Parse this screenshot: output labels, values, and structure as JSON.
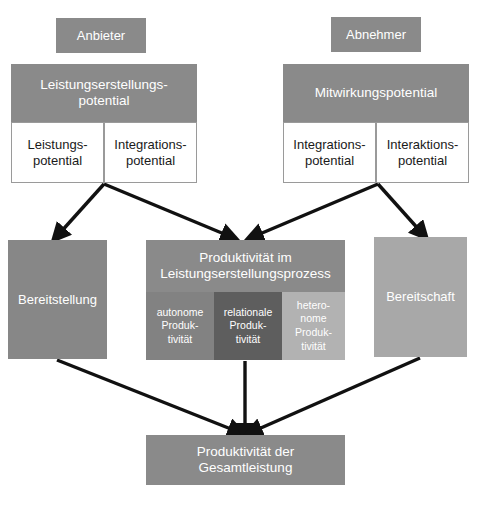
{
  "diagram": {
    "title": "Produktivität der Gesamtleistung",
    "language": "de",
    "actors": {
      "provider": "Anbieter",
      "customer": "Abnehmer"
    },
    "provider_potential": {
      "header": "Leistungserstellungs-\npotential",
      "sub_left": "Leistungs-\npotential",
      "sub_right": "Integrations-\npotential"
    },
    "customer_potential": {
      "header": "Mitwirkungspotential",
      "sub_left": "Integrations-\npotential",
      "sub_right": "Interaktions-\npotential"
    },
    "middle": {
      "provision": "Bereitstellung",
      "willingness": "Bereitschaft",
      "process_header": "Produktivität im\nLeistungserstellungsprozess",
      "process_cells": [
        "autonome\nProduk-\ntivität",
        "relationale\nProduk-\ntivität",
        "hetero-\nnome\nProduk-\ntivität"
      ]
    },
    "result": {
      "label": "Produktivität der\nGesamtleistung"
    },
    "colors": {
      "header_gray": "#8a8a8a",
      "provision_gray": "#878787",
      "willingness_gray": "#a8a8a8",
      "cell_autonomous": "#828282",
      "cell_relational": "#5e5e5e",
      "cell_heteronomous": "#b2b2b2",
      "box_border": "#9a9a9a",
      "arrow": "#111111",
      "background": "#ffffff",
      "text_on_gray": "#ffffff",
      "text_on_white": "#1a1a1a"
    }
  }
}
